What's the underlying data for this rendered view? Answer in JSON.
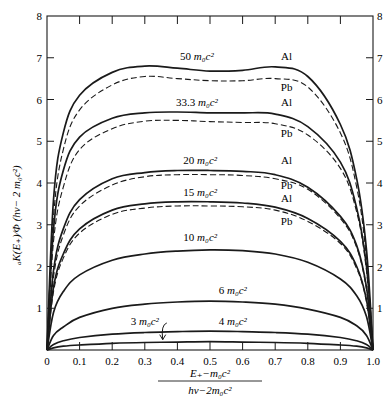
{
  "chart_data": {
    "type": "line",
    "title": "",
    "xlabel": "(E+ - m0c^2)/(hv - 2m0c^2)",
    "xlabel_numerator": "E₊−m₀c²",
    "xlabel_denominator": "hν−2m₀c²",
    "ylabel": "(αK(E+)/Φ)(hv - 2 m0c^2)",
    "ylabel_display": "ₐK(E₊)⁄Φ (hν− 2 m₀c²)",
    "xlim": [
      0,
      1.0
    ],
    "ylim": [
      0,
      8
    ],
    "grid": false,
    "x_ticks": [
      "0",
      "0.1",
      "0.2",
      "0.3",
      "0.4",
      "0.5",
      "0.6",
      "0.7",
      "0.8",
      "0.9",
      "1.0"
    ],
    "y_ticks_left": [
      "0",
      "1",
      "2",
      "3",
      "4",
      "5",
      "6",
      "7",
      "8"
    ],
    "y_ticks_right": [
      "1",
      "2",
      "3",
      "4",
      "5",
      "6",
      "7",
      "8"
    ],
    "x": [
      0,
      0.02,
      0.05,
      0.1,
      0.2,
      0.3,
      0.4,
      0.5,
      0.6,
      0.7,
      0.8,
      0.9,
      0.95,
      0.98,
      1.0
    ],
    "series": [
      {
        "name": "50 m0c² Al",
        "energy": "50 m₀c²",
        "material": "Al",
        "style": "solid",
        "values": [
          0,
          3.6,
          5.2,
          6.1,
          6.65,
          6.8,
          6.75,
          6.68,
          6.7,
          6.78,
          6.55,
          5.4,
          4.1,
          2.4,
          0
        ]
      },
      {
        "name": "50 m0c² Pb",
        "energy": "50 m₀c²",
        "material": "Pb",
        "style": "dashed",
        "values": [
          0,
          3.2,
          4.8,
          5.75,
          6.35,
          6.55,
          6.5,
          6.45,
          6.45,
          6.5,
          6.3,
          5.2,
          3.9,
          2.2,
          0
        ]
      },
      {
        "name": "33.3 m0c² Al",
        "energy": "33.3 m₀c²",
        "material": "Al",
        "style": "solid",
        "values": [
          0,
          2.9,
          4.3,
          5.1,
          5.55,
          5.68,
          5.7,
          5.68,
          5.68,
          5.65,
          5.35,
          4.5,
          3.4,
          2.0,
          0
        ]
      },
      {
        "name": "33.3 m0c² Pb",
        "energy": "33.3 m₀c²",
        "material": "Pb",
        "style": "dashed",
        "values": [
          0,
          2.6,
          3.9,
          4.8,
          5.3,
          5.48,
          5.5,
          5.47,
          5.45,
          5.42,
          5.15,
          4.35,
          3.3,
          1.9,
          0
        ]
      },
      {
        "name": "20 m0c² Al",
        "energy": "20 m₀c²",
        "material": "Al",
        "style": "solid",
        "values": [
          0,
          1.9,
          2.9,
          3.6,
          4.1,
          4.25,
          4.3,
          4.3,
          4.28,
          4.2,
          3.9,
          3.2,
          2.5,
          1.5,
          0
        ]
      },
      {
        "name": "20 m0c² Pb",
        "energy": "20 m₀c²",
        "material": "Pb",
        "style": "dashed",
        "values": [
          0,
          1.75,
          2.75,
          3.45,
          3.95,
          4.15,
          4.2,
          4.2,
          4.18,
          4.1,
          3.85,
          3.15,
          2.45,
          1.45,
          0
        ]
      },
      {
        "name": "15 m0c² Al",
        "energy": "15 m₀c²",
        "material": "Al",
        "style": "solid",
        "values": [
          0,
          1.5,
          2.3,
          2.9,
          3.35,
          3.5,
          3.55,
          3.55,
          3.52,
          3.42,
          3.15,
          2.6,
          2.0,
          1.2,
          0
        ]
      },
      {
        "name": "15 m0c² Pb",
        "energy": "15 m₀c²",
        "material": "Pb",
        "style": "dashed",
        "values": [
          0,
          1.4,
          2.2,
          2.8,
          3.25,
          3.4,
          3.45,
          3.45,
          3.43,
          3.35,
          3.08,
          2.55,
          1.95,
          1.15,
          0
        ]
      },
      {
        "name": "10 m0c²",
        "energy": "10 m₀c²",
        "material": "",
        "style": "solid",
        "values": [
          0,
          0.9,
          1.4,
          1.8,
          2.15,
          2.3,
          2.37,
          2.4,
          2.38,
          2.3,
          2.1,
          1.7,
          1.3,
          0.8,
          0
        ]
      },
      {
        "name": "6 m0c²",
        "energy": "6 m₀c²",
        "material": "",
        "style": "solid",
        "values": [
          0,
          0.35,
          0.55,
          0.78,
          1.0,
          1.1,
          1.15,
          1.17,
          1.15,
          1.1,
          0.98,
          0.78,
          0.58,
          0.35,
          0
        ]
      },
      {
        "name": "4 m0c²",
        "energy": "4 m₀c²",
        "material": "",
        "style": "solid",
        "values": [
          0,
          0.13,
          0.22,
          0.3,
          0.38,
          0.42,
          0.44,
          0.45,
          0.44,
          0.42,
          0.38,
          0.3,
          0.22,
          0.13,
          0
        ]
      },
      {
        "name": "3 m0c²",
        "energy": "3 m₀c²",
        "material": "",
        "style": "solid",
        "values": [
          0,
          0.05,
          0.09,
          0.12,
          0.16,
          0.18,
          0.19,
          0.2,
          0.19,
          0.18,
          0.16,
          0.12,
          0.09,
          0.05,
          0
        ]
      }
    ],
    "annotations": [
      {
        "text": "50 m₀c²",
        "x": 0.46,
        "y": 6.95
      },
      {
        "text": "Al",
        "x": 0.735,
        "y": 6.95
      },
      {
        "text": "Pb",
        "x": 0.735,
        "y": 6.2
      },
      {
        "text": "33.3 m₀c²",
        "x": 0.46,
        "y": 5.85
      },
      {
        "text": "Al",
        "x": 0.735,
        "y": 5.85
      },
      {
        "text": "Pb",
        "x": 0.735,
        "y": 5.1
      },
      {
        "text": "20 m₀c²",
        "x": 0.47,
        "y": 4.45
      },
      {
        "text": "Al",
        "x": 0.735,
        "y": 4.45
      },
      {
        "text": "Pb",
        "x": 0.735,
        "y": 3.85
      },
      {
        "text": "15 m₀c²",
        "x": 0.47,
        "y": 3.7
      },
      {
        "text": "Al",
        "x": 0.735,
        "y": 3.55
      },
      {
        "text": "Pb",
        "x": 0.735,
        "y": 3.0
      },
      {
        "text": "10 m₀c²",
        "x": 0.47,
        "y": 2.6
      },
      {
        "text": "6 m₀c²",
        "x": 0.57,
        "y": 1.35
      },
      {
        "text": "4 m₀c²",
        "x": 0.57,
        "y": 0.6
      },
      {
        "text": "3 m₀c²",
        "x": 0.3,
        "y": 0.6,
        "arrow_to": [
          0.355,
          0.2
        ]
      }
    ]
  }
}
